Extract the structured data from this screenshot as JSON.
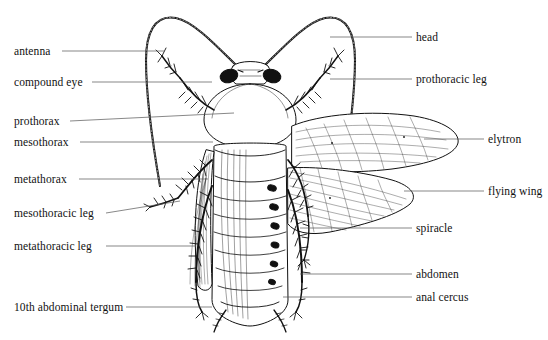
{
  "figure": {
    "background_color": "#ffffff",
    "ink_color": "#111111",
    "labels_left": [
      {
        "id": "antenna",
        "text": "antenna",
        "x": 14,
        "y": 46,
        "line": {
          "x1": 62,
          "y1": 51,
          "x2": 164,
          "y2": 51
        }
      },
      {
        "id": "compound-eye",
        "text": "compound eye",
        "x": 14,
        "y": 77,
        "line": {
          "x1": 92,
          "y1": 82,
          "x2": 212,
          "y2": 82
        }
      },
      {
        "id": "prothorax",
        "text": "prothorax",
        "x": 14,
        "y": 116,
        "line": {
          "x1": 70,
          "y1": 121,
          "x2": 234,
          "y2": 113
        }
      },
      {
        "id": "mesothorax",
        "text": "mesothorax",
        "x": 14,
        "y": 137,
        "line": {
          "x1": 80,
          "y1": 142,
          "x2": 213,
          "y2": 142
        }
      },
      {
        "id": "metathorax",
        "text": "metathorax",
        "x": 14,
        "y": 174,
        "line": {
          "x1": 79,
          "y1": 179,
          "x2": 208,
          "y2": 179
        }
      },
      {
        "id": "mesothoracic-leg",
        "text": "mesothoracic leg",
        "x": 14,
        "y": 208,
        "line": {
          "x1": 106,
          "y1": 213,
          "x2": 180,
          "y2": 201
        }
      },
      {
        "id": "metathoracic-leg",
        "text": "metathoracic leg",
        "x": 14,
        "y": 241,
        "line": {
          "x1": 106,
          "y1": 246,
          "x2": 196,
          "y2": 246
        }
      },
      {
        "id": "tenth-abdominal-tergum",
        "text": "10th abdominal tergum",
        "x": 14,
        "y": 302,
        "line": {
          "x1": 126,
          "y1": 307,
          "x2": 212,
          "y2": 307
        }
      }
    ],
    "labels_right": [
      {
        "id": "head",
        "text": "head",
        "x": 416,
        "y": 32,
        "line": {
          "x1": 330,
          "y1": 37,
          "x2": 412,
          "y2": 37
        }
      },
      {
        "id": "prothoracic-leg",
        "text": "prothoracic leg",
        "x": 416,
        "y": 74,
        "line": {
          "x1": 330,
          "y1": 79,
          "x2": 412,
          "y2": 79
        }
      },
      {
        "id": "elytron",
        "text": "elytron",
        "x": 488,
        "y": 134,
        "line": {
          "x1": 424,
          "y1": 139,
          "x2": 484,
          "y2": 139
        }
      },
      {
        "id": "flying-wing",
        "text": "flying wing",
        "x": 488,
        "y": 186,
        "line": {
          "x1": 404,
          "y1": 191,
          "x2": 484,
          "y2": 191
        }
      },
      {
        "id": "spiracle",
        "text": "spiracle",
        "x": 416,
        "y": 223,
        "line": {
          "x1": 300,
          "y1": 228,
          "x2": 412,
          "y2": 228
        }
      },
      {
        "id": "abdomen",
        "text": "abdomen",
        "x": 416,
        "y": 269,
        "line": {
          "x1": 300,
          "y1": 274,
          "x2": 412,
          "y2": 274
        }
      },
      {
        "id": "anal-cercus",
        "text": "anal cercus",
        "x": 416,
        "y": 292,
        "line": {
          "x1": 283,
          "y1": 297,
          "x2": 412,
          "y2": 297
        }
      }
    ]
  }
}
